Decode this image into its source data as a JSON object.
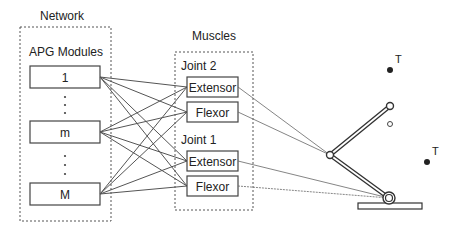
{
  "network": {
    "title": "Network",
    "group_label": "APG Modules",
    "modules": [
      {
        "label": "1",
        "cy": 77
      },
      {
        "label": "m",
        "cy": 132
      },
      {
        "label": "M",
        "cy": 194
      }
    ],
    "ellipsis_dots_upper": [
      97,
      105,
      113
    ],
    "ellipsis_dots_lower": [
      156,
      165,
      174
    ]
  },
  "muscles": {
    "title": "Muscles",
    "joints": [
      {
        "label": "Joint  2",
        "muscles": [
          {
            "label": "Extensor",
            "cy": 87,
            "target": "elbow"
          },
          {
            "label": "Flexor",
            "cy": 112,
            "target": "elbow"
          }
        ]
      },
      {
        "label": "Joint  1",
        "muscles": [
          {
            "label": "Extensor",
            "cy": 161,
            "target": "shoulder"
          },
          {
            "label": "Flexor",
            "cy": 186,
            "target": "shoulder"
          }
        ]
      }
    ]
  },
  "arm": {
    "shoulder": [
      389,
      198
    ],
    "elbow": [
      330,
      155
    ],
    "hand": [
      390,
      106
    ],
    "prev_hand": [
      390,
      124
    ],
    "base": {
      "x": 358,
      "y": 203,
      "w": 64,
      "h": 6
    }
  },
  "targets": [
    {
      "label": "T",
      "x": 390,
      "y": 70
    },
    {
      "label": "T",
      "x": 427,
      "y": 162
    }
  ],
  "colors": {
    "stroke": "#444444",
    "text": "#222222",
    "dashed": "#555555"
  }
}
